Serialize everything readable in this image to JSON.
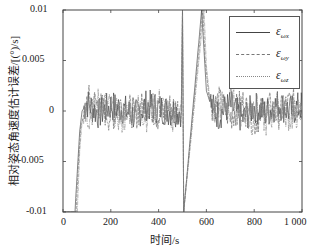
{
  "chart_data": {
    "type": "line",
    "title": "",
    "xlabel": "时间/s",
    "ylabel": "相对姿态角速度估计误差/[(°)/s]",
    "xlim": [
      0,
      1000
    ],
    "ylim": [
      -0.01,
      0.01
    ],
    "xticks": [
      "0",
      "200",
      "400",
      "600",
      "800",
      "1 000"
    ],
    "yticks": [
      "-0.01",
      "-0.005",
      "0",
      "0.005",
      "0.01"
    ],
    "grid": false,
    "legend_position": "upper right",
    "series": [
      {
        "name": "ε_ωx",
        "style": "solid",
        "x": [
          0,
          50,
          60,
          70,
          80,
          100,
          150,
          200,
          250,
          300,
          350,
          400,
          450,
          495,
          500,
          505,
          580,
          590,
          600,
          620,
          650,
          700,
          750,
          800,
          850,
          900,
          950,
          1000
        ],
        "y": [
          -0.01,
          -0.01,
          -0.006,
          -0.002,
          0.0,
          0.0008,
          -0.0003,
          0.0005,
          0.0002,
          -0.0005,
          0.0006,
          0.0003,
          0.0,
          0.0,
          0.01,
          -0.01,
          0.01,
          0.006,
          0.002,
          0.0005,
          -0.0004,
          0.0006,
          -0.0008,
          0.0004,
          -0.0002,
          0.0007,
          0.0,
          0.0005
        ]
      },
      {
        "name": "ε_ωy",
        "style": "dashed",
        "x": [
          0,
          55,
          65,
          75,
          90,
          100,
          150,
          200,
          250,
          300,
          350,
          400,
          450,
          495,
          500,
          505,
          585,
          595,
          610,
          630,
          650,
          700,
          750,
          800,
          850,
          900,
          950,
          1000
        ],
        "y": [
          -0.01,
          -0.01,
          -0.005,
          -0.0015,
          -0.0003,
          0.0012,
          0.0006,
          -0.0007,
          0.0009,
          -0.0004,
          0.0008,
          -0.0006,
          0.0004,
          0.0,
          0.01,
          -0.01,
          0.01,
          0.005,
          0.0015,
          0.0002,
          0.001,
          -0.0006,
          0.0009,
          -0.0012,
          0.0006,
          -0.0003,
          0.0008,
          0.0002
        ]
      },
      {
        "name": "ε_ωz",
        "style": "dash-dot",
        "x": [
          0,
          60,
          70,
          80,
          95,
          110,
          150,
          200,
          250,
          300,
          350,
          400,
          450,
          495,
          500,
          505,
          590,
          600,
          615,
          640,
          660,
          700,
          750,
          800,
          850,
          900,
          950,
          1000
        ],
        "y": [
          -0.01,
          -0.01,
          -0.004,
          -0.001,
          0.0002,
          -0.0005,
          0.001,
          0.0003,
          -0.0009,
          0.0006,
          -0.0005,
          0.0009,
          -0.0007,
          0.0,
          0.01,
          -0.01,
          0.01,
          0.0045,
          0.001,
          -0.0006,
          0.0005,
          0.001,
          -0.0004,
          0.0006,
          -0.001,
          0.0004,
          -0.0006,
          0.0
        ]
      }
    ]
  },
  "legend": {
    "items": [
      {
        "label": "ε",
        "sub": "ωx"
      },
      {
        "label": "ε",
        "sub": "ωy"
      },
      {
        "label": "ε",
        "sub": "ωz"
      }
    ]
  },
  "axes": {
    "xlabel": "时间/s",
    "ylabel": "相对姿态角速度估计误差/[(°)/s]",
    "xticks": [
      "0",
      "200",
      "400",
      "600",
      "800",
      "1 000"
    ],
    "yticks": [
      "0.01",
      "0.005",
      "0",
      "-0.005",
      "-0.01"
    ]
  }
}
